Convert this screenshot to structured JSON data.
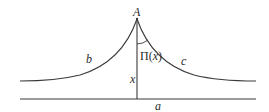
{
  "colors": {
    "stroke": "#3a3a3a",
    "text": "#2a2a2a",
    "background": "#ffffff"
  },
  "labels": {
    "vertex": "A",
    "left_curve": "b",
    "right_curve": "c",
    "angle": "Π(x)",
    "perpendicular": "x",
    "baseline": "a"
  },
  "geometry": {
    "apex": [
      137,
      19
    ],
    "foot": [
      137,
      99
    ],
    "baseline_y": 99,
    "baseline_x": [
      20,
      256
    ],
    "curve_end_y": 81
  }
}
